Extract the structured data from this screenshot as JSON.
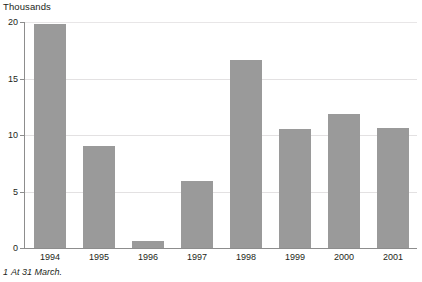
{
  "chart_data": {
    "type": "bar",
    "title": "",
    "subtitle": "",
    "unit_label": "Thousands",
    "xlabel": "",
    "ylabel": "Thousands",
    "categories": [
      "1994",
      "1995",
      "1996",
      "1997",
      "1998",
      "1999",
      "2000",
      "2001"
    ],
    "values": [
      19.8,
      9.0,
      0.6,
      5.9,
      16.6,
      10.5,
      11.9,
      10.6
    ],
    "series": [
      {
        "name": "Thousands",
        "values": [
          19.8,
          9.0,
          0.6,
          5.9,
          16.6,
          10.5,
          11.9,
          10.6
        ]
      }
    ],
    "ylim": [
      0,
      20
    ],
    "yticks": [
      0,
      5,
      10,
      15,
      20
    ],
    "ytick_labels": [
      "0",
      "5",
      "10",
      "15",
      "20"
    ],
    "grid": true,
    "grid_axis": "y",
    "legend": false,
    "legend_position": "none",
    "bar_color": "#9a9a9a",
    "gridline_color": "#e3e1e2",
    "axis_color": "#8d8d8d",
    "background_color": "#ffffff",
    "annotations": []
  },
  "footnote": {
    "marker": "1",
    "text": "At 31 March."
  }
}
